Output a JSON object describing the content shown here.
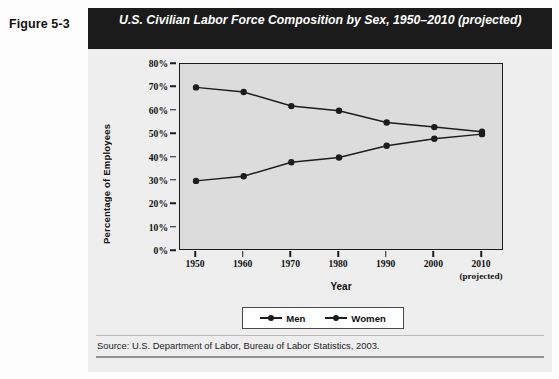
{
  "figure": {
    "label": "Figure 5-3",
    "title": "U.S. Civilian Labor Force Composition by Sex, 1950–2010 (projected)",
    "source": "Source: U.S. Department of Labor, Bureau of Labor Statistics, 2003."
  },
  "colors": {
    "title_bar_bg": "#1b1b1b",
    "title_bar_text": "#ffffff",
    "plot_bg": "#dcdcdc",
    "card_bg": "#eeeeee",
    "series_line": "#1c1c1c",
    "axis": "#1c1c1c"
  },
  "chart_data": {
    "type": "line",
    "title": "U.S. Civilian Labor Force Composition by Sex, 1950–2010 (projected)",
    "xlabel": "Year",
    "ylabel": "Percentage of Employees",
    "x": [
      1950,
      1960,
      1970,
      1980,
      1990,
      2000,
      2010
    ],
    "xtick_labels": [
      "1950",
      "1960",
      "1970",
      "1980",
      "1990",
      "2000",
      "2010"
    ],
    "xtick_sublabels": [
      "",
      "",
      "",
      "",
      "",
      "",
      "(projected)"
    ],
    "ytick_labels": [
      "0%",
      "10%",
      "20%",
      "30%",
      "40%",
      "50%",
      "60%",
      "70%",
      "80%"
    ],
    "ytick_values": [
      0,
      10,
      20,
      30,
      40,
      50,
      60,
      70,
      80
    ],
    "ylim": [
      0,
      80
    ],
    "grid": false,
    "legend_position": "bottom-center",
    "series": [
      {
        "name": "Men",
        "values": [
          70,
          68,
          62,
          60,
          55,
          53,
          51
        ]
      },
      {
        "name": "Women",
        "values": [
          30,
          32,
          38,
          40,
          45,
          48,
          50
        ]
      }
    ]
  },
  "legend": {
    "items": [
      {
        "label": "Men"
      },
      {
        "label": "Women"
      }
    ]
  }
}
